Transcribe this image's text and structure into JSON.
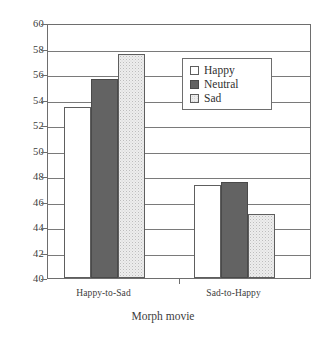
{
  "chart_data": {
    "type": "bar",
    "title": "",
    "xlabel": "Morph movie",
    "ylabel": "",
    "categories": [
      "Happy-to-Sad",
      "Sad-to-Happy"
    ],
    "series": [
      {
        "name": "Happy",
        "values": [
          53.4,
          47.3
        ]
      },
      {
        "name": "Neutral",
        "values": [
          55.6,
          47.5
        ]
      },
      {
        "name": "Sad",
        "values": [
          57.6,
          45.0
        ]
      }
    ],
    "ylim": [
      40,
      60
    ],
    "yticks": [
      40,
      42,
      44,
      46,
      48,
      50,
      52,
      54,
      56,
      58,
      60
    ],
    "ytick_labels": [
      "40",
      "42",
      "44",
      "46",
      "48",
      "50",
      "52",
      "54",
      "56",
      "58",
      "60"
    ],
    "grid": true,
    "grid_axis": "y",
    "legend_position": "upper center inside",
    "legend_entries": [
      "Happy",
      "Neutral",
      "Sad"
    ],
    "colors": {
      "happy": "#ffffff",
      "neutral": "#636363",
      "sad": "#ededed",
      "axis": "#6e6e6e",
      "grid": "#7a7a7a",
      "text": "#3c3c3c"
    }
  }
}
